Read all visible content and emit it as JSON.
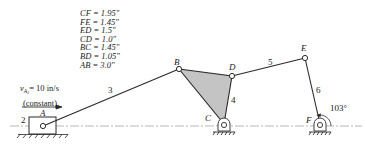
{
  "dimensions": [
    "CF = 1.95\"",
    "FE = 1.45\"",
    "ED = 1.5\"",
    "CD = 1.0\"",
    "BC = 1.45\"",
    "BD = 1.05\"",
    "AB = 3.0\""
  ],
  "velocity": {
    "symbol": "v",
    "subscript": "A",
    "subscript2": "2",
    "value": "= 10 in/s",
    "note": "(constant)"
  },
  "joints": {
    "A": "A",
    "B": "B",
    "C": "C",
    "D": "D",
    "E": "E",
    "F": "F"
  },
  "links": {
    "l2": "2",
    "l3": "3",
    "l4": "4",
    "l5": "5",
    "l6": "6"
  },
  "angle": "103°",
  "colors": {
    "line": "#2a2a2a",
    "fill": "#c4c4c4",
    "centerline": "#888888"
  }
}
